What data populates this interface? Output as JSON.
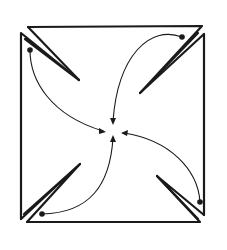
{
  "diagram": {
    "type": "pinwheel-fold",
    "stroke_color": "#1a1a1a",
    "background_color": "#ffffff",
    "flaps": [
      {
        "id": "top-left",
        "dot": [
          30,
          50
        ],
        "target": [
          105,
          131
        ]
      },
      {
        "id": "top-right",
        "dot": [
          182,
          37
        ],
        "target": [
          113,
          123
        ]
      },
      {
        "id": "bottom-right",
        "dot": [
          200,
          202
        ],
        "target": [
          122,
          133
        ]
      },
      {
        "id": "bottom-left",
        "dot": [
          42,
          214
        ],
        "target": [
          113,
          135
        ]
      }
    ],
    "center_label": ""
  }
}
